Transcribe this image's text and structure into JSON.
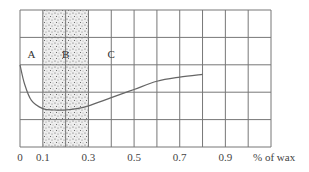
{
  "chart_data": {
    "type": "line",
    "title": "",
    "xlabel": "% of wax",
    "ylabel": "",
    "xlim": [
      0,
      1.1
    ],
    "ylim": [
      0,
      5
    ],
    "grid": true,
    "x_ticks": [
      "0",
      "0.1",
      "0.3",
      "0.5",
      "0.7",
      "0.9"
    ],
    "x_tick_values": [
      0,
      0.1,
      0.3,
      0.5,
      0.7,
      0.9
    ],
    "shaded_region": {
      "from": 0.1,
      "to": 0.3,
      "style": "stippled",
      "label": "B"
    },
    "regions": [
      {
        "label": "A",
        "x": 0.05
      },
      {
        "label": "B",
        "x": 0.2
      },
      {
        "label": "C",
        "x": 0.4
      }
    ],
    "series": [
      {
        "name": "curve",
        "x": [
          0,
          0.02,
          0.05,
          0.1,
          0.15,
          0.2,
          0.25,
          0.3,
          0.4,
          0.5,
          0.6,
          0.7,
          0.8
        ],
        "y": [
          3.0,
          2.3,
          1.7,
          1.4,
          1.35,
          1.35,
          1.4,
          1.5,
          1.8,
          2.1,
          2.4,
          2.55,
          2.65
        ]
      }
    ]
  }
}
